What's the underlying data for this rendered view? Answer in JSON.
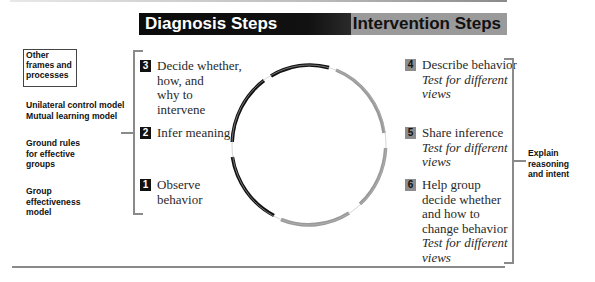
{
  "header": {
    "diagnosis_label": "Diagnosis Steps",
    "intervention_label": "Intervention Steps"
  },
  "left_column": {
    "frames_box": "Other frames and processes",
    "models": [
      "Unilateral control model",
      "Mutual learning model"
    ],
    "ground_rules": "Ground rules for effective groups",
    "group_model": "Group effectiveness model"
  },
  "diagnosis_steps": [
    {
      "number": "3",
      "lines": [
        "Decide whether,",
        "how, and",
        "why to",
        "intervene"
      ]
    },
    {
      "number": "2",
      "lines": [
        "Infer meaning"
      ]
    },
    {
      "number": "1",
      "lines": [
        "Observe",
        "behavior"
      ]
    }
  ],
  "intervention_steps": [
    {
      "number": "4",
      "lines": [
        "Describe behavior"
      ],
      "test": [
        "Test for different",
        "views"
      ]
    },
    {
      "number": "5",
      "lines": [
        "Share inference"
      ],
      "test": [
        "Test for different",
        "views"
      ]
    },
    {
      "number": "6",
      "lines": [
        "Help group",
        "decide whether",
        "and how to",
        "change behavior"
      ],
      "test": [
        "Test for different",
        "views"
      ]
    }
  ],
  "right_label": [
    "Explain",
    "reasoning",
    "and intent"
  ],
  "colors": {
    "diagnosis": "#111111",
    "intervention": "#9a9a9a",
    "bracket": "#8a8a8a"
  }
}
